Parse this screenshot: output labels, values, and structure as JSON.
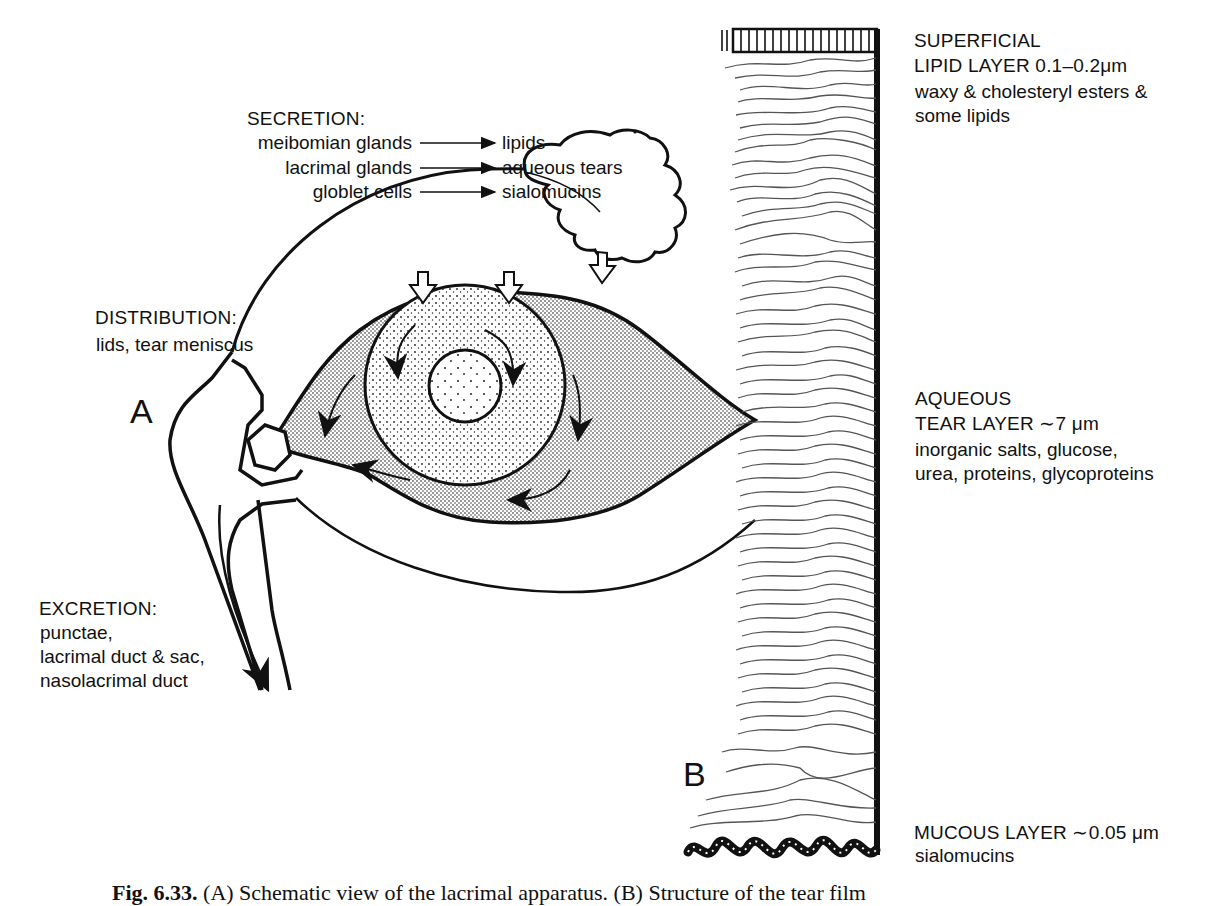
{
  "figure": {
    "panel_a_label": "A",
    "panel_b_label": "B",
    "caption_prefix": "Fig. 6.33.",
    "caption_text": "(A) Schematic view of the lacrimal apparatus. (B) Structure of the tear film"
  },
  "secretion": {
    "heading": "SECRETION:",
    "rows": [
      {
        "source": "meibomian glands",
        "product": "lipids"
      },
      {
        "source": "lacrimal glands",
        "product": "aqueous tears"
      },
      {
        "source": "globlet cells",
        "product": "sialomucins"
      }
    ]
  },
  "distribution": {
    "heading": "DISTRIBUTION:",
    "text": "lids, tear meniscus"
  },
  "excretion": {
    "heading": "EXCRETION:",
    "lines": [
      "punctae,",
      "lacrimal duct & sac,",
      "nasolacrimal duct"
    ]
  },
  "tear_film_layers": [
    {
      "name_line1": "SUPERFICIAL",
      "name_line2": "LIPID LAYER 0.1–0.2μm",
      "desc_line1": "waxy & cholesteryl esters &",
      "desc_line2": "some lipids"
    },
    {
      "name_line1": "AQUEOUS",
      "name_line2": "TEAR LAYER ∼7 μm",
      "desc_line1": "inorganic salts, glucose,",
      "desc_line2": "urea, proteins, glycoproteins"
    },
    {
      "name_line1": "MUCOUS LAYER ∼0.05 μm",
      "desc_line1": "sialomucins"
    }
  ],
  "icons": {
    "flow_arrow": "arrow-right-icon"
  }
}
